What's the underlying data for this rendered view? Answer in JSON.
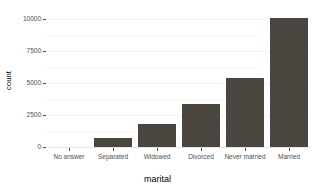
{
  "chart_data": {
    "type": "bar",
    "title": "",
    "subtitle": "",
    "xlabel": "marital",
    "ylabel": "count",
    "categories": [
      "No answer",
      "Separated",
      "Widowed",
      "Divorced",
      "Never married",
      "Married"
    ],
    "values": [
      17,
      743,
      1807,
      3383,
      5416,
      10117
    ],
    "ylim": [
      0,
      10400
    ],
    "y_ticks": [
      0,
      2500,
      5000,
      7500,
      10000
    ],
    "y_tick_labels": [
      "0",
      "2500",
      "5000",
      "7500",
      "10000"
    ],
    "grid": true,
    "grid_minor": [
      1250,
      3750,
      6250,
      8750
    ],
    "legend": "none",
    "bar_color": "#4b4540",
    "panel_background": "#ffffff",
    "gridline_color": "#f4f2f0",
    "axis_text_color": "#4d4d4d",
    "axis_title_color": "#000000"
  }
}
